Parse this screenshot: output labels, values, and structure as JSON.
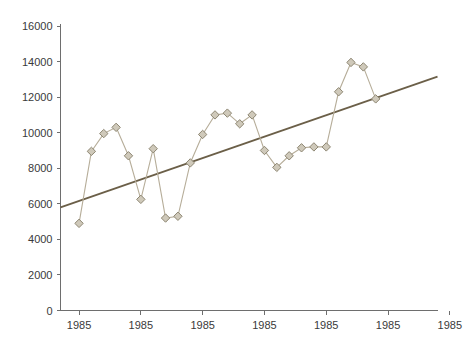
{
  "chart_data": {
    "type": "line",
    "title": "",
    "xlabel": "",
    "ylabel": "",
    "ylim": [
      0,
      16000
    ],
    "grid": false,
    "legend": "none",
    "y_ticks": [
      "0",
      "2000",
      "4000",
      "6000",
      "8000",
      "10000",
      "12000",
      "14000",
      "16000"
    ],
    "y_tick_values": [
      0,
      2000,
      4000,
      6000,
      8000,
      10000,
      12000,
      14000,
      16000
    ],
    "x_ticks": [
      "1985",
      "1985",
      "1985",
      "1985",
      "1985",
      "1985",
      "1985"
    ],
    "x_tick_positions": [
      1,
      6,
      11,
      16,
      21,
      26,
      31
    ],
    "x": [
      1,
      2,
      3,
      4,
      5,
      6,
      7,
      8,
      9,
      10,
      11,
      12,
      13,
      14,
      15,
      16,
      17,
      18,
      19,
      20,
      21,
      22,
      23,
      24,
      25
    ],
    "series": [
      {
        "name": "data",
        "marker": "diamond",
        "color": "#b6ad99",
        "values": [
          4900,
          8950,
          9950,
          10300,
          8700,
          6250,
          9100,
          5200,
          5300,
          8300,
          9900,
          11000,
          11100,
          10500,
          11000,
          9000,
          8050,
          8700,
          9150,
          9200,
          9200,
          12300,
          13950,
          13700,
          11900
        ]
      },
      {
        "name": "trend",
        "type": "trendline",
        "color": "#6b5f48",
        "x_endpoints": [
          -0.5,
          30
        ],
        "y_endpoints": [
          5800,
          13150
        ]
      }
    ]
  }
}
